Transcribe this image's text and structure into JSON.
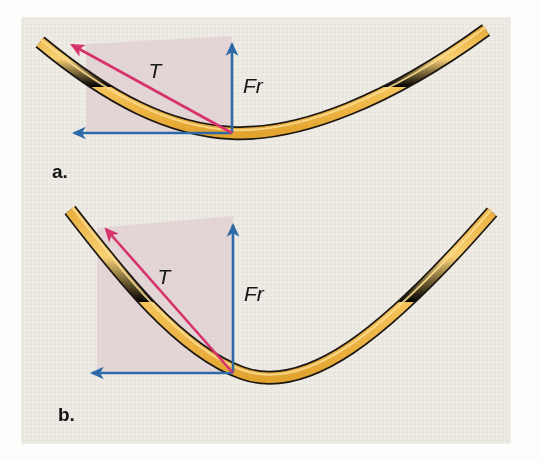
{
  "figure": {
    "kind": "physics-force-diagram",
    "title_text": "",
    "background_color": "#fdfdfb",
    "panel_color": "#ece9e2",
    "panel_texture": "woven-paper",
    "cable_fill": "#f5c45a",
    "cable_highlight": "#fadd94",
    "cable_outline": "#1b1712",
    "tension_arrow_color": "#d6336c",
    "force_arrow_color": "#2f6ba8",
    "shaded_region_color": "#e0cfd2",
    "panel_bounds": {
      "x": 22,
      "y": 18,
      "width": 488,
      "height": 425
    }
  },
  "panels": [
    {
      "id": "panel-a",
      "label": "a.",
      "label_pos": {
        "x": 52,
        "y": 175
      },
      "caption": "Shallow cable sag: large tension, small vertical resultant",
      "cable": {
        "name": "cable-a",
        "description": "shallow catenary, gentle sag",
        "path": "M 40 42 C 110 100 170 130 232 133 C 300 136 390 100 486 30",
        "thickness": 11
      },
      "vertex": {
        "x": 232,
        "y": 133
      },
      "shaded_region": {
        "name": "force-parallelogram-a",
        "points": "86,38 232,38 232,133 86,133",
        "skew_points": "86,46 232,38 232,133 86,133"
      },
      "vectors": [
        {
          "name": "tension-vector",
          "label": "T",
          "label_pos": {
            "x": 155,
            "y": 76
          },
          "color": "#d6336c",
          "from": {
            "x": 232,
            "y": 133
          },
          "to": {
            "x": 66,
            "y": 41
          },
          "width": 2.6
        },
        {
          "name": "resultant-force-vector",
          "label": "Fr",
          "label_pos": {
            "x": 243,
            "y": 90
          },
          "color": "#2f6ba8",
          "from": {
            "x": 232,
            "y": 133
          },
          "to": {
            "x": 232,
            "y": 37
          },
          "width": 2.6
        },
        {
          "name": "horizontal-component-vector",
          "label": "",
          "label_pos": {
            "x": 0,
            "y": 0
          },
          "color": "#2f6ba8",
          "from": {
            "x": 232,
            "y": 133
          },
          "to": {
            "x": 68,
            "y": 133
          },
          "width": 2.6
        }
      ]
    },
    {
      "id": "panel-b",
      "label": "b.",
      "label_pos": {
        "x": 58,
        "y": 418
      },
      "caption": "Deep cable sag: smaller tension, large vertical resultant",
      "cable": {
        "name": "cable-b",
        "description": "deep catenary, pronounced sag",
        "path": "M 70 210 C 120 270 180 350 240 373 C 300 396 380 340 492 212",
        "thickness": 11
      },
      "vertex": {
        "x": 233,
        "y": 373
      },
      "shaded_region": {
        "name": "force-parallelogram-b",
        "points": "97,218 233,218 233,373 97,373",
        "skew_points": "97,228 233,218 233,373 97,373"
      },
      "vectors": [
        {
          "name": "tension-vector",
          "label": "T",
          "label_pos": {
            "x": 163,
            "y": 281
          },
          "color": "#d6336c",
          "from": {
            "x": 233,
            "y": 373
          },
          "to": {
            "x": 100,
            "y": 222
          },
          "width": 2.6
        },
        {
          "name": "resultant-force-vector",
          "label": "Fr",
          "label_pos": {
            "x": 244,
            "y": 298
          },
          "color": "#2f6ba8",
          "from": {
            "x": 233,
            "y": 373
          },
          "to": {
            "x": 233,
            "y": 219
          },
          "width": 2.6
        },
        {
          "name": "horizontal-component-vector",
          "label": "",
          "label_pos": {
            "x": 0,
            "y": 0
          },
          "color": "#2f6ba8",
          "from": {
            "x": 233,
            "y": 373
          },
          "to": {
            "x": 86,
            "y": 373
          },
          "width": 2.6
        }
      ]
    }
  ]
}
